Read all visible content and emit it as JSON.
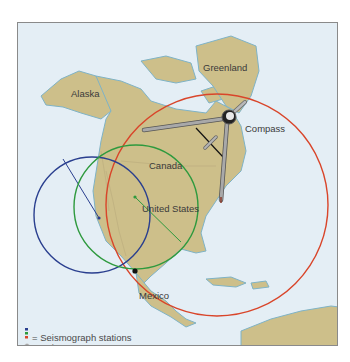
{
  "labels": {
    "alaska": "Alaska",
    "greenland": "Greenland",
    "canada": "Canada",
    "united_states": "United States",
    "mexico": "Mexico",
    "compass": "Compass"
  },
  "legend": {
    "stations": "= Seismograph stations",
    "epicenter": "= Epicenter"
  },
  "colors": {
    "blue_station": "#2a3f8f",
    "green_station": "#2e9a3e",
    "red_station": "#d9452a",
    "epicenter": "#111111",
    "ocean": "#e4eef5",
    "land": "#cdbf8a"
  }
}
